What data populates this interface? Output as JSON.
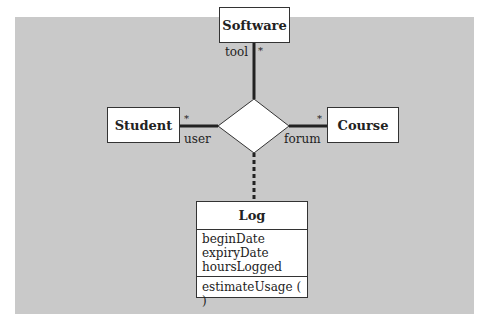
{
  "diagram": {
    "type": "UML association class diagram (ternary association)",
    "colors": {
      "background": "#c9c9c9",
      "box_fill": "#ffffff",
      "line": "#222222"
    },
    "classes": [
      {
        "id": "software",
        "name": "Software"
      },
      {
        "id": "student",
        "name": "Student"
      },
      {
        "id": "course",
        "name": "Course"
      }
    ],
    "association": {
      "shape": "diamond",
      "ends": [
        {
          "class": "software",
          "role": "tool",
          "multiplicity": "*"
        },
        {
          "class": "student",
          "role": "user",
          "multiplicity": "*"
        },
        {
          "class": "course",
          "role": "forum",
          "multiplicity": "*"
        }
      ],
      "association_class": {
        "name": "Log",
        "attributes": [
          "beginDate",
          "expiryDate",
          "hoursLogged"
        ],
        "operations": [
          "estimateUsage ( )"
        ]
      }
    }
  }
}
